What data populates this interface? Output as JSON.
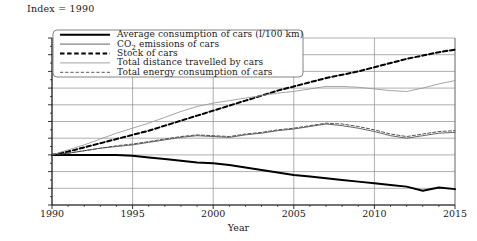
{
  "annotation": {
    "index_note": "Index = 1990"
  },
  "axes": {
    "xlabel": "Year",
    "ylabel": "",
    "ytick_labels": [
      "70",
      "80",
      "90",
      "100",
      "110",
      "120",
      "130",
      "140",
      "150",
      "160",
      "170"
    ],
    "xtick_labels": [
      "1990",
      "1995",
      "2000",
      "2005",
      "2010",
      "2015"
    ]
  },
  "legend": {
    "items": [
      {
        "label": "Average consumption of cars (l/100 km)",
        "style": "thick-solid-black",
        "color": "#000000"
      },
      {
        "label": "CO₂ emissions of cars",
        "style": "thin-solid-gray",
        "color": "#555555"
      },
      {
        "label": "Stock of cars",
        "style": "thick-dashed-black",
        "color": "#000000"
      },
      {
        "label": "Total distance travelled by cars",
        "style": "thin-solid-lightgray",
        "color": "#9a9a9a"
      },
      {
        "label": "Total energy consumption of cars",
        "style": "thin-dashed-gray",
        "color": "#444444"
      }
    ]
  },
  "chart_data": {
    "type": "line",
    "title": "",
    "subtitle": "",
    "annotation": "Index = 1990",
    "xlabel": "Year",
    "ylabel": "",
    "xlim": [
      1990,
      2015
    ],
    "ylim": [
      70,
      170
    ],
    "ytick_step": 10,
    "xtick_step": 5,
    "grid": "horizontal-and-vertical-major",
    "legend_position": "top-left-inside",
    "x": [
      1990,
      1991,
      1992,
      1993,
      1994,
      1995,
      1996,
      1997,
      1998,
      1999,
      2000,
      2001,
      2002,
      2003,
      2004,
      2005,
      2006,
      2007,
      2008,
      2009,
      2010,
      2011,
      2012,
      2013,
      2014,
      2015
    ],
    "series": [
      {
        "name": "Average consumption of cars (l/100 km)",
        "color": "#000000",
        "linestyle": "solid",
        "linewidth": 2.0,
        "values": [
          100,
          100,
          100,
          100,
          100,
          99.5,
          98.5,
          97.5,
          96.5,
          95.5,
          95,
          94,
          92.5,
          91,
          89.5,
          88,
          87,
          86,
          85,
          84,
          83,
          82,
          81,
          78.5,
          80.5,
          79.5
        ]
      },
      {
        "name": "CO₂ emissions of cars",
        "color": "#555555",
        "linestyle": "solid",
        "linewidth": 0.9,
        "values": [
          100,
          101,
          102.5,
          104,
          105,
          106,
          107.5,
          109,
          110.5,
          111.5,
          111,
          110.5,
          112,
          113,
          114.5,
          115.5,
          117,
          118.5,
          117.5,
          116,
          114,
          111.5,
          110,
          111.5,
          113,
          113.5
        ]
      },
      {
        "name": "Stock of cars",
        "color": "#000000",
        "linestyle": "dashed",
        "linewidth": 2.0,
        "values": [
          100,
          102,
          104.5,
          107,
          109.5,
          112,
          114.5,
          117.5,
          120.5,
          123.5,
          126.5,
          129.5,
          132.5,
          135.5,
          138.5,
          141,
          143.5,
          146,
          148,
          150,
          152.5,
          155,
          157.5,
          159.5,
          161.5,
          163
        ]
      },
      {
        "name": "Total distance travelled by cars",
        "color": "#9a9a9a",
        "linestyle": "solid",
        "linewidth": 0.9,
        "values": [
          100,
          103,
          106,
          109.5,
          113,
          116,
          119,
          122.5,
          126,
          129,
          131,
          132.5,
          134,
          135.5,
          137,
          138,
          139.5,
          141,
          141,
          140.5,
          139.5,
          138.5,
          138,
          140,
          142.5,
          144.5
        ]
      },
      {
        "name": "Total energy consumption of cars",
        "color": "#444444",
        "linestyle": "dashed",
        "linewidth": 0.9,
        "values": [
          100,
          101,
          102.5,
          104,
          105.5,
          106.5,
          108,
          109.5,
          111,
          112,
          111.5,
          111,
          112.5,
          113.5,
          115,
          116,
          117.5,
          119,
          118.5,
          117,
          115,
          112.5,
          111,
          112.5,
          114,
          114.5
        ]
      }
    ]
  }
}
